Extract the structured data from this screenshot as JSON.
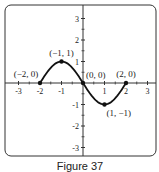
{
  "chart_data": {
    "type": "line",
    "title": "",
    "caption": "Figure 37",
    "xlabel": "",
    "ylabel": "",
    "xlim": [
      -3.5,
      3.5
    ],
    "ylim": [
      -3.5,
      3.5
    ],
    "x_ticks": [
      "-3",
      "-2",
      "-1",
      "1",
      "2",
      "3"
    ],
    "y_ticks": [
      "3",
      "2",
      "1",
      "-1",
      "-2",
      "-3"
    ],
    "grid": false,
    "series": [
      {
        "name": "curve",
        "points": [
          [
            -2,
            0
          ],
          [
            -1,
            1
          ],
          [
            0,
            0
          ],
          [
            1,
            -1
          ],
          [
            2,
            0
          ]
        ]
      }
    ],
    "annotations": [
      {
        "text": "(-2, 0)",
        "x": -2,
        "y": 0
      },
      {
        "text": "(-1, 1)",
        "x": -1,
        "y": 1
      },
      {
        "text": "(0, 0)",
        "x": 0,
        "y": 0
      },
      {
        "text": "(2, 0)",
        "x": 2,
        "y": 0
      },
      {
        "text": "(1, -1)",
        "x": 1,
        "y": -1
      }
    ]
  }
}
